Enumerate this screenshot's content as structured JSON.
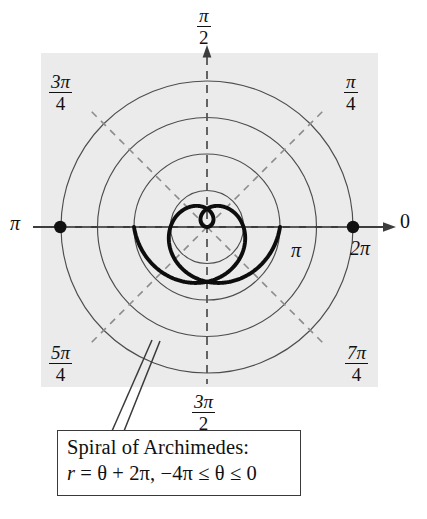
{
  "figure": {
    "title_box": {
      "line1": "Spiral of Archimedes:",
      "line2_r": "r",
      "line2_rest": " = θ + 2π, −4π ≤ θ ≤ 0"
    },
    "axis_labels": {
      "right": "0",
      "left": "π",
      "top_num": "π",
      "top_den": "2",
      "bottom_num": "3π",
      "bottom_den": "2",
      "ne_num": "π",
      "ne_den": "4",
      "nw_num": "3π",
      "nw_den": "4",
      "sw_num": "5π",
      "sw_den": "4",
      "se_num": "7π",
      "se_den": "4"
    },
    "radial_labels": {
      "inner_pi": "π",
      "outer_2pi": "2π"
    },
    "colors": {
      "plot_background": "#ebebeb",
      "grid_circle": "#4d4d4d",
      "dashed_ray": "#8c8c8c",
      "curve": "#0d0d0d",
      "axis": "#3d3d3d",
      "caption_border": "#3a3a3a",
      "page_background": "#ffffff"
    }
  },
  "chart_data": {
    "type": "line",
    "plot_kind": "polar",
    "title": "Spiral of Archimedes:",
    "equation": "r = θ + 2π, −4π ≤ θ ≤ 0",
    "theta_label": "θ",
    "r_label": "r",
    "theta_min": -12.566370614359172,
    "theta_max": 0,
    "theta_min_display": "−4π",
    "theta_max_display": "0",
    "r_function": "theta + 2*pi",
    "r_at_theta_min": -6.283185307179586,
    "r_at_theta_max": 6.283185307179586,
    "grid": {
      "circles_r": [
        3.141592653589793,
        6.283185307179586,
        9.42477796076938,
        12.566370614359172
      ],
      "circles_r_display": [
        "π",
        "2π",
        "3π",
        "4π"
      ],
      "labeled_circles": [
        "π",
        "2π"
      ],
      "rays_deg": [
        0,
        45,
        90,
        135,
        180,
        225,
        270,
        315
      ],
      "ray_labels": [
        "0",
        "π/4",
        "π/2",
        "3π/4",
        "π",
        "5π/4",
        "3π/2",
        "7π/4"
      ],
      "grid_on": true,
      "legend": "none"
    },
    "endpoints": [
      {
        "theta_display": "π",
        "r": 6.283185307179586,
        "marker": "filled-dot",
        "side": "left"
      },
      {
        "theta_display": "0",
        "r": 12.566370614359172,
        "marker": "filled-dot",
        "side": "right"
      }
    ],
    "rmax_display": "4π"
  }
}
